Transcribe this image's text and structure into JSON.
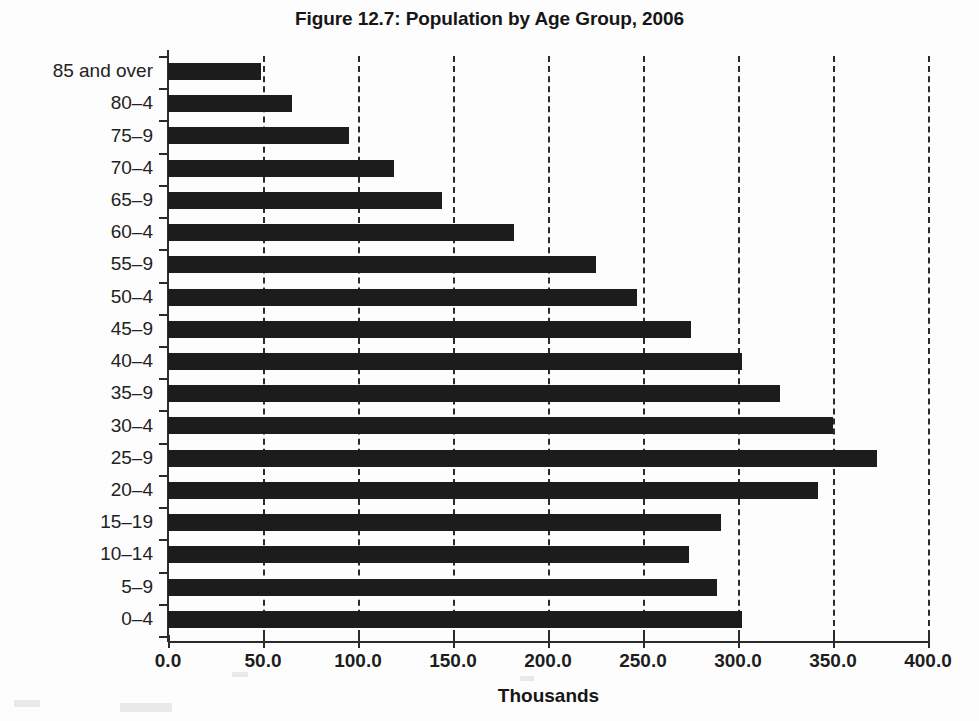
{
  "chart_data": {
    "type": "bar",
    "orientation": "horizontal",
    "title": "Figure 12.7: Population by Age Group, 2006",
    "xlabel": "Thousands",
    "ylabel": "",
    "xlim": [
      0.0,
      400.0
    ],
    "xticks": [
      "0.0",
      "50.0",
      "100.0",
      "150.0",
      "200.0",
      "250.0",
      "300.0",
      "350.0",
      "400.0"
    ],
    "xtick_values": [
      0,
      50,
      100,
      150,
      200,
      250,
      300,
      350,
      400
    ],
    "grid": "vertical dashed gridlines at each x tick",
    "legend": "none",
    "bar_color": "#1c1c1c",
    "categories": [
      "85 and over",
      "80–4",
      "75–9",
      "70–4",
      "65–9",
      "60–4",
      "55–9",
      "50–4",
      "45–9",
      "40–4",
      "35–9",
      "30–4",
      "25–9",
      "20–4",
      "15–19",
      "10–14",
      "5–9",
      "0–4"
    ],
    "values": [
      49.0,
      65.0,
      95.0,
      119.0,
      144.0,
      182.0,
      225.0,
      247.0,
      275.0,
      302.0,
      322.0,
      350.0,
      373.0,
      342.0,
      291.0,
      274.0,
      289.0,
      302.0
    ]
  }
}
